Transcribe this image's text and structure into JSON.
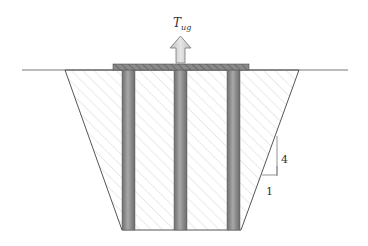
{
  "diagram": {
    "force_label": "T",
    "force_subscript": "ug",
    "slope_rise": "4",
    "slope_run": "1",
    "colors": {
      "line": "#666666",
      "hatch": "#cfcfcf",
      "cap": "#8a8a8a",
      "pile": "#8c8c8c",
      "arrow": "#cccccc"
    }
  }
}
